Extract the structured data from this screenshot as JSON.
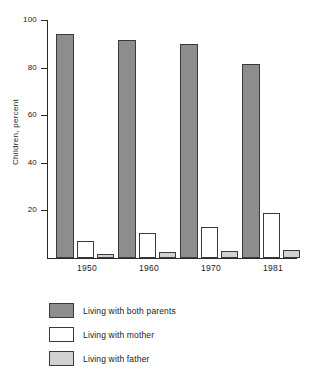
{
  "chart_data": {
    "type": "bar",
    "title": "",
    "xlabel": "",
    "ylabel": "Children, percent",
    "categories": [
      "1950",
      "1960",
      "1970",
      "1981"
    ],
    "ylim": [
      0,
      100
    ],
    "yticks": [
      20,
      40,
      60,
      80,
      100
    ],
    "grid": false,
    "legend_position": "below",
    "series": [
      {
        "name": "Living with both parents",
        "color": "#8d8d8d",
        "values": [
          94,
          91.5,
          90,
          81.5
        ]
      },
      {
        "name": "Living with mother",
        "color": "#ffffff",
        "values": [
          7,
          10.5,
          13,
          19
        ]
      },
      {
        "name": "Living with father",
        "color": "#d2d2d2",
        "values": [
          1.5,
          2.5,
          3,
          3.5
        ]
      }
    ]
  },
  "axis": {
    "y_title": "Children, percent",
    "y_tick_labels": [
      "100",
      "80",
      "60",
      "40",
      "20"
    ],
    "x_tick_labels": [
      "1950",
      "1960",
      "1970",
      "1981"
    ]
  },
  "legend": {
    "items": [
      {
        "label": "Living with both parents",
        "swatch": "both"
      },
      {
        "label": "Living with mother",
        "swatch": "mother"
      },
      {
        "label": "Living with father",
        "swatch": "father"
      }
    ]
  }
}
